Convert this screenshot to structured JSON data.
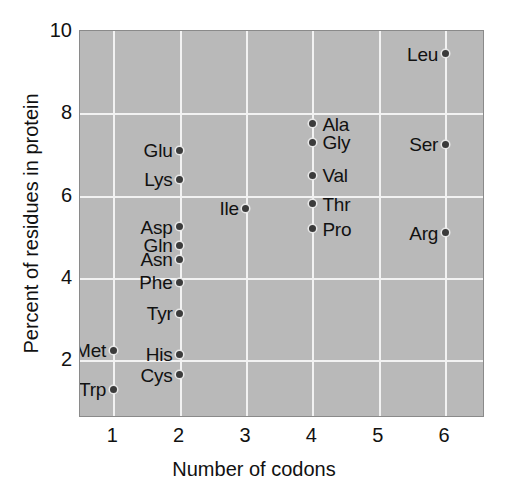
{
  "chart_data": {
    "type": "scatter",
    "title": "",
    "xlabel": "Number of codons",
    "ylabel": "Percent of residues in protein",
    "xlim": [
      0.5,
      6.6
    ],
    "ylim": [
      0.6,
      10.0
    ],
    "xticks": [
      "1",
      "2",
      "3",
      "4",
      "5",
      "6"
    ],
    "xtick_values": [
      1,
      2,
      3,
      4,
      5,
      6
    ],
    "yticks": [
      "2",
      "4",
      "6",
      "8",
      "10"
    ],
    "ytick_values": [
      2,
      4,
      6,
      8,
      10
    ],
    "grid": true,
    "legend": false,
    "plot_background": "#b9b9b9",
    "grid_color": "#f2f2f2",
    "point_color": "#3b3b3b",
    "points": [
      {
        "label": "Leu",
        "x": 6,
        "y": 9.45,
        "side": "left"
      },
      {
        "label": "Ala",
        "x": 4,
        "y": 7.75,
        "side": "right"
      },
      {
        "label": "Gly",
        "x": 4,
        "y": 7.3,
        "side": "right"
      },
      {
        "label": "Ser",
        "x": 6,
        "y": 7.25,
        "side": "left"
      },
      {
        "label": "Glu",
        "x": 2,
        "y": 7.1,
        "side": "left"
      },
      {
        "label": "Val",
        "x": 4,
        "y": 6.5,
        "side": "right"
      },
      {
        "label": "Lys",
        "x": 2,
        "y": 6.4,
        "side": "left"
      },
      {
        "label": "Ile",
        "x": 3,
        "y": 5.7,
        "side": "left"
      },
      {
        "label": "Thr",
        "x": 4,
        "y": 5.8,
        "side": "right"
      },
      {
        "label": "Pro",
        "x": 4,
        "y": 5.2,
        "side": "right"
      },
      {
        "label": "Arg",
        "x": 6,
        "y": 5.1,
        "side": "left"
      },
      {
        "label": "Asp",
        "x": 2,
        "y": 5.25,
        "side": "left"
      },
      {
        "label": "Gln",
        "x": 2,
        "y": 4.8,
        "side": "left"
      },
      {
        "label": "Asn",
        "x": 2,
        "y": 4.45,
        "side": "left"
      },
      {
        "label": "Phe",
        "x": 2,
        "y": 3.9,
        "side": "left"
      },
      {
        "label": "Tyr",
        "x": 2,
        "y": 3.15,
        "side": "left"
      },
      {
        "label": "Met",
        "x": 1,
        "y": 2.25,
        "side": "left"
      },
      {
        "label": "His",
        "x": 2,
        "y": 2.15,
        "side": "left"
      },
      {
        "label": "Cys",
        "x": 2,
        "y": 1.65,
        "side": "left"
      },
      {
        "label": "Trp",
        "x": 1,
        "y": 1.3,
        "side": "left"
      }
    ]
  }
}
